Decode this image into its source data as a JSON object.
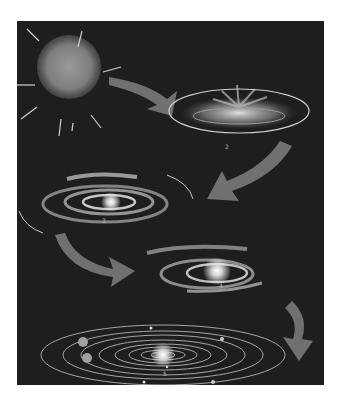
{
  "figure": {
    "colors": {
      "background": "#1e1e1e",
      "page": "#ffffff",
      "arrow": "#707070",
      "glow": "#ffffff",
      "rings": "#c8c8c8"
    },
    "stages": [
      {
        "id": 1,
        "label": "",
        "description": "collapsing nebula cloud with inward arrows"
      },
      {
        "id": 2,
        "label": "2",
        "description": "flattening rotating disk with central burst"
      },
      {
        "id": 3,
        "label": "3",
        "description": "spiral disk with bright center"
      },
      {
        "id": 4,
        "label": "4",
        "description": "contracting disk with protostar"
      },
      {
        "id": 5,
        "label": "5",
        "description": "sun with concentric planetary orbits"
      }
    ]
  }
}
